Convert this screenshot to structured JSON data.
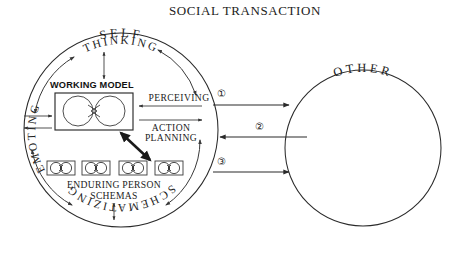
{
  "diagram": {
    "title": "SOCIAL TRANSACTION",
    "self": {
      "label": "SELF",
      "cycle_labels": {
        "thinking": "THINKING",
        "emoting": "EMOTING",
        "schematizing": "SCHEMATIZING"
      },
      "working_model": {
        "label": "WORKING MODEL",
        "nodes": 2
      },
      "enduring_person_schemas": {
        "line1": "ENDURING PERSON",
        "line2": "SCHEMAS",
        "count": 4
      },
      "interface_labels": {
        "perceiving": "PERCEIVING",
        "action_planning_line1": "ACTION",
        "action_planning_line2": "PLANNING"
      }
    },
    "other": {
      "label": "OTHER"
    },
    "transactions": [
      {
        "id": "1",
        "marker": "①",
        "direction": "self-to-other"
      },
      {
        "id": "2",
        "marker": "②",
        "direction": "other-to-self"
      },
      {
        "id": "3",
        "marker": "③",
        "direction": "self-to-other"
      }
    ],
    "colors": {
      "ink": "#2a2a2a",
      "background": "#ffffff"
    }
  }
}
